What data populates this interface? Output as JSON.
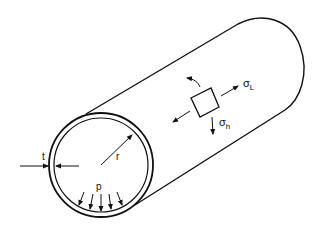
{
  "diagram": {
    "labels": {
      "thickness": "t",
      "radius": "r",
      "pressure": "p",
      "sigma": "σ",
      "longitudinal_sub": "L",
      "hoop_sub": "h"
    },
    "colors": {
      "stroke": "#111111",
      "background": "#ffffff"
    }
  }
}
